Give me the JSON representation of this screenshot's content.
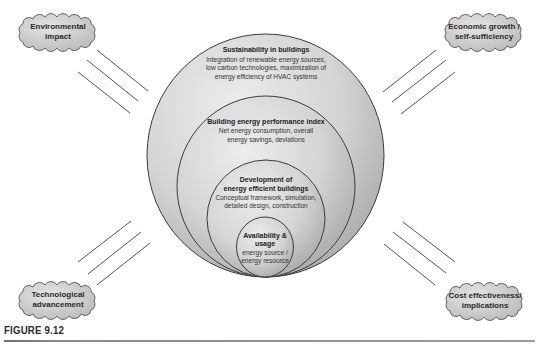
{
  "figure": {
    "caption": "FIGURE 9.12"
  },
  "rings": [
    {
      "title": "Sustainability in buildings",
      "lines": [
        "Integration of renewable energy sources,",
        "low carbon technologies, maximization of",
        "energy efficiency of HVAC systems"
      ]
    },
    {
      "title": "Building energy performance index",
      "lines": [
        "Net energy consumption, overall",
        "energy savings, deviations"
      ]
    },
    {
      "title_lines": [
        "Development of",
        "energy efficient buildings"
      ],
      "lines": [
        "Conceptual framework, simulation,",
        "detailed design, construction"
      ]
    },
    {
      "title_lines": [
        "Availability &",
        "usage"
      ],
      "lines": [
        "energy source /",
        "energy resource"
      ]
    }
  ],
  "factors": {
    "top_left": {
      "lines": [
        "Environmental",
        "impact"
      ]
    },
    "top_right": {
      "lines": [
        "Economic growth /",
        "self-sufficiency"
      ]
    },
    "bottom_left": {
      "lines": [
        "Technological",
        "advancement"
      ]
    },
    "bottom_right": {
      "lines": [
        "Cost effectiveness/",
        "implications"
      ]
    }
  },
  "colors": {
    "ring_fill_light": "#e6e6e6",
    "ring_fill_dark": "#a9a9a9",
    "ring_stroke": "#3c3c3c",
    "cloud_fill": "#d2d2d2",
    "line_stroke": "#555555"
  }
}
